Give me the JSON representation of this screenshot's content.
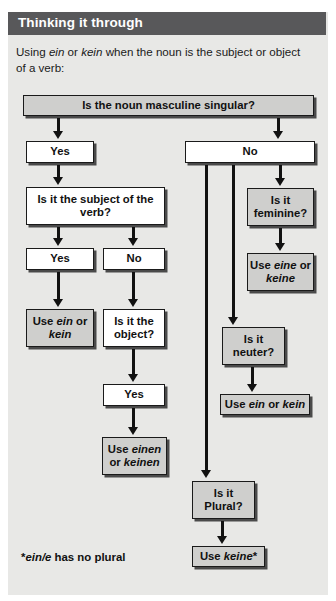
{
  "header": {
    "title": "Thinking it through"
  },
  "intro": {
    "part1": "Using ",
    "em1": "ein",
    "part2": " or ",
    "em2": "kein",
    "part3": " when the noun is the subject or object of a verb:"
  },
  "nodes": {
    "root": "Is the noun masculine singular?",
    "yes_masc": "Yes",
    "no_masc": "No",
    "subject_q": "Is it the subject of the verb?",
    "yes_subject": "Yes",
    "no_subject": "No",
    "use_ein_kein_1": "Use ein or kein",
    "object_q": "Is it the object?",
    "yes_object": "Yes",
    "use_einen_keinen": "Use einen or keinen",
    "feminine_q": "Is it feminine?",
    "use_eine_keine": "Use eine or keine",
    "neuter_q": "Is it neuter?",
    "use_ein_kein_2": "Use ein or kein",
    "plural_q": "Is it Plural?",
    "use_keine": "Use keine*"
  },
  "footnote": {
    "star": "*",
    "em": "ein/e",
    "rest": " has no plural"
  },
  "colors": {
    "header_bar": "#58585a",
    "panel": "#e8e8e6",
    "gray_box": "#cfcfcd",
    "white_box": "#ffffff",
    "line": "#111111"
  }
}
